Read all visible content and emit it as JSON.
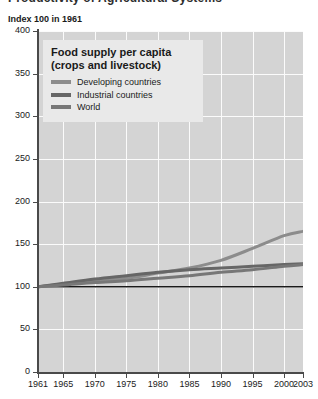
{
  "page": {
    "heading_cut_off": "Productivity of Agricultural Systems"
  },
  "chart_data": {
    "type": "line",
    "title": "Food supply per capita",
    "subtitle": "(crops and livestock)",
    "axis_caption": "Index 100 in 1961",
    "xlabel": "",
    "ylabel": "",
    "grid": true,
    "legend_position": "top-left inside plot",
    "xlim": [
      1961,
      2003
    ],
    "ylim": [
      0,
      400
    ],
    "yticks": [
      0,
      50,
      100,
      150,
      200,
      250,
      300,
      350,
      400
    ],
    "xticks": [
      1961,
      1965,
      1970,
      1975,
      1980,
      1985,
      1990,
      1995,
      2000,
      2003
    ],
    "reference_line": {
      "value": 100,
      "color": "#1a1a1a"
    },
    "x": [
      1961,
      1965,
      1970,
      1975,
      1980,
      1985,
      1990,
      1995,
      2000,
      2003
    ],
    "series": [
      {
        "name": "Developing countries",
        "color": "#8c8c8c",
        "values": [
          100,
          103,
          107,
          110,
          116,
          122,
          131,
          145,
          160,
          165
        ]
      },
      {
        "name": "Industrial countries",
        "color": "#666666",
        "values": [
          100,
          104,
          109,
          113,
          117,
          120,
          122,
          124,
          126,
          127
        ]
      },
      {
        "name": "World",
        "color": "#777777",
        "values": [
          100,
          102,
          105,
          107,
          110,
          113,
          117,
          120,
          124,
          126
        ]
      }
    ]
  }
}
